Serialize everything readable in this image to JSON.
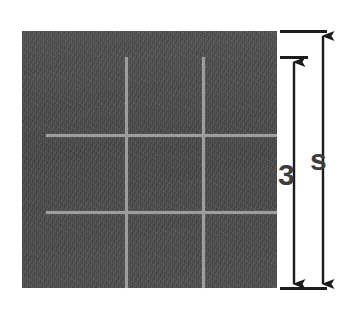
{
  "figure": {
    "type": "geometry-diagram",
    "shape": {
      "name": "square",
      "fill_color": "#4a4a4a",
      "texture": "rough-grainy",
      "grid": {
        "rows": 3,
        "columns": 3,
        "line_color": "#9d9d9d",
        "vertical_lines": 2,
        "horizontal_lines": 2
      }
    },
    "dimensions": [
      {
        "id": "inner",
        "label": "3",
        "orientation": "vertical",
        "arrow_style": "double-headed",
        "position": "right-inner",
        "describes": "height of three grid cells"
      },
      {
        "id": "outer",
        "label": "s",
        "orientation": "vertical",
        "arrow_style": "double-headed",
        "position": "right-outer",
        "describes": "full side length of the square"
      }
    ],
    "label_color": "#3d3d3d"
  }
}
